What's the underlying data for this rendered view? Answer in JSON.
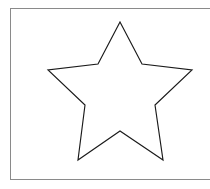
{
  "figure": {
    "canvas": {
      "width": 210,
      "height": 189,
      "background_color": "#ffffff"
    },
    "frame": {
      "name": "figure-border",
      "x": 10,
      "y": 8,
      "width": 206,
      "height": 172,
      "stroke_color": "#8a8a8a",
      "stroke_width": 1,
      "fill_color": "#ffffff",
      "note": "right edge clipped by image boundary"
    },
    "shape": {
      "name": "five-pointed-star",
      "type": "polygon",
      "fill": "none",
      "stroke_color": "#1a1a1a",
      "stroke_width": 1.15,
      "point_count": 5,
      "center": {
        "x": 120,
        "y": 92
      },
      "outer_radius": 72,
      "inner_radius": 29,
      "points": [
        {
          "role": "outer-top",
          "x": 120,
          "y": 22
        },
        {
          "role": "inner-upper-right",
          "x": 142,
          "y": 64
        },
        {
          "role": "outer-right",
          "x": 192,
          "y": 70
        },
        {
          "role": "inner-right",
          "x": 155,
          "y": 105
        },
        {
          "role": "outer-lower-right",
          "x": 163,
          "y": 160
        },
        {
          "role": "inner-bottom",
          "x": 120,
          "y": 131
        },
        {
          "role": "outer-lower-left",
          "x": 78,
          "y": 160
        },
        {
          "role": "inner-left",
          "x": 85,
          "y": 105
        },
        {
          "role": "outer-left",
          "x": 48,
          "y": 70
        },
        {
          "role": "inner-upper-left",
          "x": 98,
          "y": 64
        }
      ],
      "path": "M120,22 L142,64 L192,70 L155,105 L163,160 L120,131 L78,160 L85,105 L48,70 L98,64 Z"
    }
  }
}
